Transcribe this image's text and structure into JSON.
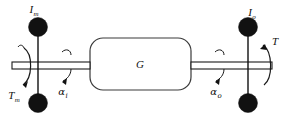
{
  "figure": {
    "type": "engineering-schematic",
    "background_color": "#ffffff",
    "line_color": "#1a1a1a",
    "disc_color": "#111111"
  },
  "gearbox": {
    "label": "G",
    "name": "gear-ratio-block"
  },
  "input_side": {
    "inertia_label": "I",
    "inertia_subscript": "m",
    "torque_label": "T",
    "torque_subscript": "m",
    "accel_label": "α",
    "accel_subscript": "i"
  },
  "output_side": {
    "inertia_label": "I",
    "inertia_subscript": "o",
    "torque_label": "T",
    "torque_subscript": "",
    "accel_label": "α",
    "accel_subscript": "o"
  }
}
